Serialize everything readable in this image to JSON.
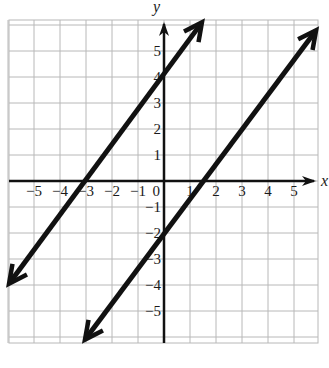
{
  "chart_data": {
    "type": "line",
    "title": "",
    "xlabel": "x",
    "ylabel": "y",
    "xlim": [
      -6,
      6
    ],
    "ylim": [
      -6.2,
      6.2
    ],
    "grid": true,
    "x_ticks": [
      -5,
      -4,
      -3,
      -2,
      -1,
      0,
      1,
      2,
      3,
      4,
      5
    ],
    "y_ticks": [
      -5,
      -4,
      -3,
      -2,
      -1,
      1,
      2,
      3,
      4,
      5
    ],
    "x_tick_labels": [
      "−5",
      "−4",
      "−3",
      "−2",
      "−1",
      "0",
      "1",
      "2",
      "3",
      "4",
      "5"
    ],
    "y_tick_labels": [
      "−5",
      "−4",
      "−3",
      "−2",
      "−1",
      "1",
      "2",
      "3",
      "4",
      "5"
    ],
    "series": [
      {
        "name": "line-1",
        "equation": "y = (4/3)x + 4",
        "slope": 1.3333,
        "intercept": 4,
        "x_intercept": -3,
        "endpoints": [
          [
            -5.96,
            -3.95
          ],
          [
            1.46,
            6.1
          ]
        ],
        "arrows": "both"
      },
      {
        "name": "line-2",
        "equation": "y = (4/3)x - 2",
        "slope": 1.3333,
        "intercept": -2,
        "x_intercept": 1.5,
        "endpoints": [
          [
            -3.04,
            -6.1
          ],
          [
            5.85,
            5.8
          ]
        ],
        "arrows": "both"
      }
    ]
  },
  "layout": {
    "origin_px": [
      164,
      181
    ],
    "unit_px": 26,
    "grid_left": 9,
    "grid_right": 318,
    "grid_top": 20,
    "grid_bottom": 343,
    "colors": {
      "line": "#111111",
      "grid": "#b8b8b8",
      "axis": "#111111"
    }
  }
}
